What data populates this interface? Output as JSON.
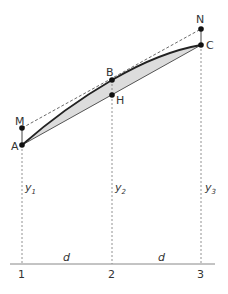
{
  "diagram": {
    "points": {
      "A": {
        "label": "A",
        "x": 22,
        "y": 145
      },
      "M": {
        "label": "M",
        "x": 22,
        "y": 128
      },
      "B": {
        "label": "B",
        "x": 112,
        "y": 80
      },
      "H": {
        "label": "H",
        "x": 112,
        "y": 95
      },
      "C": {
        "label": "C",
        "x": 201,
        "y": 45
      },
      "N": {
        "label": "N",
        "x": 201,
        "y": 29
      }
    },
    "ordinates": [
      {
        "label": "y",
        "sub": "1"
      },
      {
        "label": "y",
        "sub": "2"
      },
      {
        "label": "y",
        "sub": "3"
      }
    ],
    "stations": [
      "1",
      "2",
      "3"
    ],
    "spacing_labels": [
      "d",
      "d"
    ],
    "colors": {
      "curve": "#222222",
      "chord": "#555555",
      "fill": "#dcdcdc",
      "dashed": "#777777",
      "baseline": "#888888",
      "points": "#111111"
    }
  }
}
